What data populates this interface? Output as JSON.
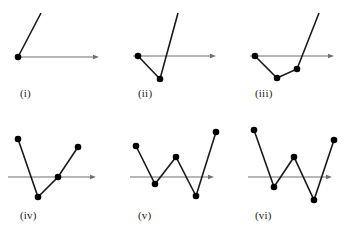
{
  "figure": {
    "title": "",
    "background_color": "#ffffff",
    "axis_color": "#6e6e6e",
    "curve_color": "#1a1a1a",
    "dot_color": "#000000",
    "label_color": "#222222",
    "dot_radius": 3.3,
    "curve_width": 1.6,
    "axis_width": 1.0,
    "panel_count": 6
  },
  "chart_data": {
    "type": "line",
    "title": "",
    "xlabel": "",
    "ylabel": "",
    "grid": false,
    "legend": null,
    "panels": [
      {
        "label": "(i)",
        "label_x": 20,
        "label_y": 88,
        "axis": {
          "x1": 18,
          "y": 57,
          "x2": 99,
          "arrow": true
        },
        "polyline": [
          {
            "x": 41,
            "y": 13,
            "dot": false
          },
          {
            "x": 18,
            "y": 57,
            "dot": true
          }
        ],
        "vertex_count": 1,
        "ray_endpoints": [
          {
            "x": 41,
            "y": 13
          }
        ]
      },
      {
        "label": "(ii)",
        "label_x": 138,
        "label_y": 88,
        "axis": {
          "x1": 133,
          "y": 56,
          "x2": 216,
          "arrow": true
        },
        "polyline": [
          {
            "x": 138,
            "y": 56,
            "dot": true
          },
          {
            "x": 160,
            "y": 79,
            "dot": true
          },
          {
            "x": 178,
            "y": 13,
            "dot": false
          }
        ],
        "vertex_count": 2,
        "ray_endpoints": [
          {
            "x": 178,
            "y": 13
          }
        ]
      },
      {
        "label": "(iii)",
        "label_x": 255,
        "label_y": 88,
        "axis": {
          "x1": 250,
          "y": 56,
          "x2": 334,
          "arrow": true
        },
        "polyline": [
          {
            "x": 255,
            "y": 56,
            "dot": true
          },
          {
            "x": 277,
            "y": 78,
            "dot": true
          },
          {
            "x": 297,
            "y": 69,
            "dot": true
          },
          {
            "x": 319,
            "y": 13,
            "dot": false
          }
        ],
        "vertex_count": 3,
        "ray_endpoints": [
          {
            "x": 319,
            "y": 13
          }
        ]
      },
      {
        "label": "(iv)",
        "label_x": 20,
        "label_y": 210,
        "axis": {
          "x1": 8,
          "y": 177,
          "x2": 96,
          "arrow": true
        },
        "polyline": [
          {
            "x": 18,
            "y": 139,
            "dot": true
          },
          {
            "x": 38,
            "y": 197,
            "dot": true
          },
          {
            "x": 58,
            "y": 177,
            "dot": true
          },
          {
            "x": 78,
            "y": 147,
            "dot": true
          }
        ],
        "vertex_count": 4,
        "ray_endpoints": []
      },
      {
        "label": "(v)",
        "label_x": 138,
        "label_y": 210,
        "axis": {
          "x1": 130,
          "y": 177,
          "x2": 214,
          "arrow": true
        },
        "polyline": [
          {
            "x": 136,
            "y": 146,
            "dot": true
          },
          {
            "x": 155,
            "y": 184,
            "dot": true
          },
          {
            "x": 176,
            "y": 157,
            "dot": true
          },
          {
            "x": 196,
            "y": 196,
            "dot": true
          },
          {
            "x": 216,
            "y": 132,
            "dot": true
          }
        ],
        "vertex_count": 5,
        "ray_endpoints": []
      },
      {
        "label": "(vi)",
        "label_x": 255,
        "label_y": 210,
        "axis": {
          "x1": 248,
          "y": 177,
          "x2": 332,
          "arrow": true
        },
        "polyline": [
          {
            "x": 254,
            "y": 130,
            "dot": true
          },
          {
            "x": 274,
            "y": 187,
            "dot": true
          },
          {
            "x": 294,
            "y": 157,
            "dot": true
          },
          {
            "x": 314,
            "y": 200,
            "dot": true
          },
          {
            "x": 334,
            "y": 140,
            "dot": true
          }
        ],
        "vertex_count": 5,
        "ray_endpoints": []
      }
    ]
  }
}
